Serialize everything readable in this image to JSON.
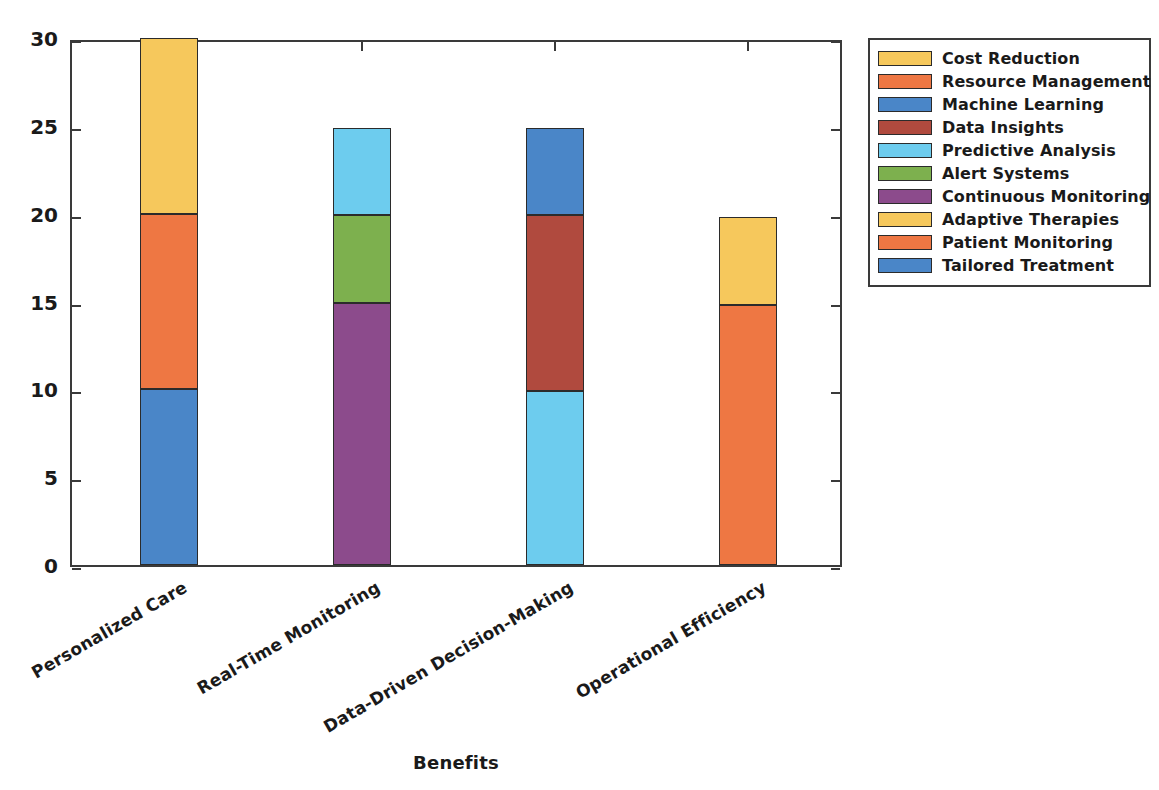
{
  "chart_data": {
    "type": "bar",
    "subtype": "stacked",
    "title": "",
    "xlabel": "Benefits",
    "ylabel": "Contribution Level (%)",
    "ylim": [
      0,
      30
    ],
    "yticks": [
      0,
      5,
      10,
      15,
      20,
      25,
      30
    ],
    "ytick_labels": [
      "0",
      "5",
      "10",
      "15",
      "20",
      "25",
      "30"
    ],
    "grid": false,
    "legend_position": "upper right (outside axes)",
    "categories": [
      "Personalized Care",
      "Real-Time Monitoring",
      "Data-Driven Decision-Making",
      "Operational Efficiency"
    ],
    "series": [
      {
        "name": "Cost Reduction",
        "color": "#F6C85C",
        "values": [
          10.0,
          0.0,
          0.0,
          0.0
        ]
      },
      {
        "name": "Resource Management",
        "color": "#EE7743",
        "values": [
          10.0,
          0.0,
          0.0,
          0.0
        ]
      },
      {
        "name": "Machine Learning",
        "color": "#4A86C8",
        "values": [
          0.0,
          0.0,
          5.0,
          0.0
        ]
      },
      {
        "name": "Data Insights",
        "color": "#B04A3E",
        "values": [
          0.0,
          0.0,
          10.0,
          0.0
        ]
      },
      {
        "name": "Predictive Analysis",
        "color": "#6DCCEE",
        "values": [
          0.0,
          5.0,
          9.9,
          0.0
        ]
      },
      {
        "name": "Alert Systems",
        "color": "#7DB04E",
        "values": [
          0.0,
          5.0,
          0.0,
          0.0
        ]
      },
      {
        "name": "Continuous Monitoring",
        "color": "#8C4B8C",
        "values": [
          0.0,
          14.9,
          0.0,
          0.0
        ]
      },
      {
        "name": "Adaptive Therapies",
        "color": "#F6C85C",
        "values": [
          0.0,
          0.0,
          0.0,
          5.0
        ]
      },
      {
        "name": "Patient Monitoring",
        "color": "#EE7743",
        "values": [
          0.0,
          0.0,
          0.0,
          14.8
        ]
      },
      {
        "name": "Tailored Treatment",
        "color": "#4A86C8",
        "values": [
          10.0,
          0.0,
          0.0,
          0.0
        ]
      }
    ],
    "stacks": [
      {
        "category": "Personalized Care",
        "total": 30.0,
        "segments": [
          {
            "name": "Tailored Treatment",
            "color": "#4A86C8",
            "from": 0.0,
            "to": 10.0
          },
          {
            "name": "Resource Management",
            "color": "#EE7743",
            "from": 10.0,
            "to": 20.0
          },
          {
            "name": "Cost Reduction",
            "color": "#F6C85C",
            "from": 20.0,
            "to": 30.0
          }
        ]
      },
      {
        "category": "Real-Time Monitoring",
        "total": 24.9,
        "segments": [
          {
            "name": "Continuous Monitoring",
            "color": "#8C4B8C",
            "from": 0.0,
            "to": 14.9
          },
          {
            "name": "Alert Systems",
            "color": "#7DB04E",
            "from": 14.9,
            "to": 19.9
          },
          {
            "name": "Predictive Analysis",
            "color": "#6DCCEE",
            "from": 19.9,
            "to": 24.9
          }
        ]
      },
      {
        "category": "Data-Driven Decision-Making",
        "total": 24.9,
        "segments": [
          {
            "name": "Predictive Analysis",
            "color": "#6DCCEE",
            "from": 0.0,
            "to": 9.9
          },
          {
            "name": "Data Insights",
            "color": "#B04A3E",
            "from": 9.9,
            "to": 19.9
          },
          {
            "name": "Machine Learning",
            "color": "#4A86C8",
            "from": 19.9,
            "to": 24.9
          }
        ]
      },
      {
        "category": "Operational Efficiency",
        "total": 19.8,
        "segments": [
          {
            "name": "Patient Monitoring",
            "color": "#EE7743",
            "from": 0.0,
            "to": 14.8
          },
          {
            "name": "Adaptive Therapies",
            "color": "#F6C85C",
            "from": 14.8,
            "to": 19.8
          }
        ]
      }
    ]
  },
  "legend": {
    "items": [
      {
        "label": "Cost Reduction",
        "color": "#F6C85C"
      },
      {
        "label": "Resource Management",
        "color": "#EE7743"
      },
      {
        "label": "Machine Learning",
        "color": "#4A86C8"
      },
      {
        "label": "Data Insights",
        "color": "#B04A3E"
      },
      {
        "label": "Predictive Analysis",
        "color": "#6DCCEE"
      },
      {
        "label": "Alert Systems",
        "color": "#7DB04E"
      },
      {
        "label": "Continuous Monitoring",
        "color": "#8C4B8C"
      },
      {
        "label": "Adaptive Therapies",
        "color": "#F6C85C"
      },
      {
        "label": "Patient Monitoring",
        "color": "#EE7743"
      },
      {
        "label": "Tailored Treatment",
        "color": "#4A86C8"
      }
    ]
  },
  "axes": {
    "y_title": "Contribution Level (%)",
    "x_title": "Benefits"
  }
}
